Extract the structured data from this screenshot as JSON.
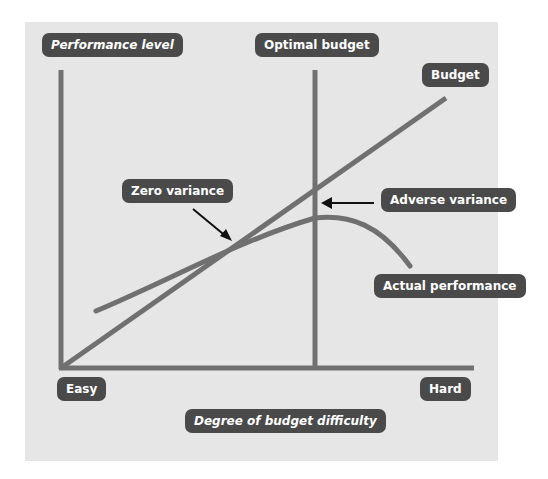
{
  "diagram": {
    "labels": {
      "y_axis": "Performance level",
      "optimal_budget": "Optimal budget",
      "budget": "Budget",
      "zero_variance": "Zero variance",
      "adverse_variance": "Adverse variance",
      "actual_performance": "Actual performance",
      "easy": "Easy",
      "hard": "Hard",
      "x_axis": "Degree of budget difficulty"
    },
    "colors": {
      "background": "#e6e6e6",
      "line": "#707070",
      "label_bg": "#4a4a4a",
      "label_text": "#ffffff",
      "arrow": "#111111"
    }
  }
}
